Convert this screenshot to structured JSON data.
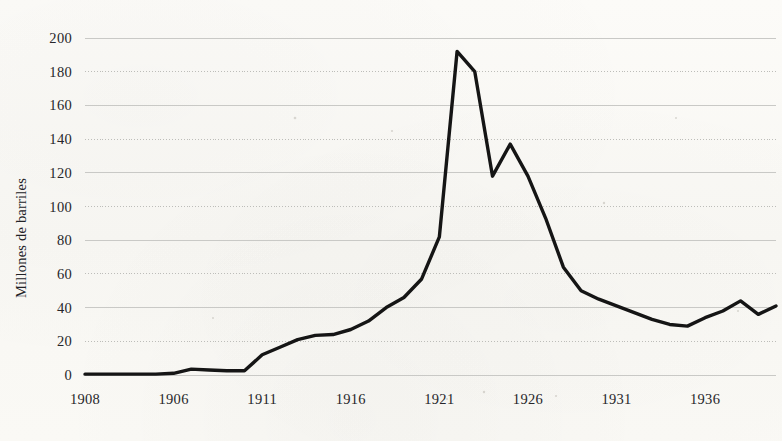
{
  "chart": {
    "title": "",
    "ylabel": "Millones de barriles",
    "xlabel": "",
    "line_color": "#151515",
    "grid_color": "#c9c9c6",
    "background_color": "#fbfaf7"
  },
  "axes": {
    "y_ticks": [
      "0",
      "20",
      "40",
      "60",
      "80",
      "100",
      "120",
      "140",
      "160",
      "180",
      "200"
    ],
    "x_ticks": [
      "1908",
      "1906",
      "1911",
      "1916",
      "1921",
      "1926",
      "1931",
      "1936"
    ]
  },
  "chart_data": {
    "type": "line",
    "title": "",
    "xlabel": "",
    "ylabel": "Millones de barriles",
    "xlim": [
      1901,
      1940
    ],
    "ylim": [
      0,
      200
    ],
    "grid": true,
    "legend": false,
    "y_ticks": [
      0,
      20,
      40,
      60,
      80,
      100,
      120,
      140,
      160,
      180,
      200
    ],
    "x_tick_labels": [
      "1908",
      "1906",
      "1911",
      "1916",
      "1921",
      "1926",
      "1931",
      "1936"
    ],
    "x_tick_values": [
      1901,
      1906,
      1911,
      1916,
      1921,
      1926,
      1931,
      1936
    ],
    "series": [
      {
        "name": "Millones de barriles",
        "x": [
          1901,
          1902,
          1903,
          1904,
          1905,
          1906,
          1907,
          1908,
          1909,
          1910,
          1911,
          1912,
          1913,
          1914,
          1915,
          1916,
          1917,
          1918,
          1919,
          1920,
          1921,
          1922,
          1923,
          1924,
          1925,
          1926,
          1927,
          1928,
          1929,
          1930,
          1931,
          1932,
          1933,
          1934,
          1935,
          1936,
          1937,
          1938,
          1939,
          1940
        ],
        "values": [
          0.5,
          0.5,
          0.5,
          0.5,
          0.5,
          1,
          3.5,
          3,
          2.5,
          2.5,
          12,
          16.5,
          21,
          23.5,
          24,
          27,
          32,
          40,
          46,
          57,
          82,
          192,
          180,
          118,
          137,
          118,
          93,
          64,
          50,
          45,
          41,
          37,
          33,
          30,
          29,
          34,
          38,
          44,
          36,
          41
        ]
      }
    ]
  }
}
